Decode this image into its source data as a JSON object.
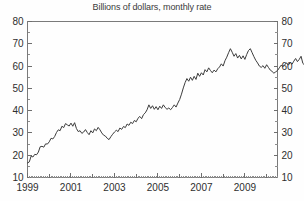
{
  "chart_data": {
    "type": "line",
    "title": "Billions of dollars, monthly rate",
    "xlabel": "",
    "ylabel": "",
    "ylim": [
      10,
      80
    ],
    "xlim": [
      1999.0,
      2010.5
    ],
    "ytick_step": 10,
    "yticks": [
      10,
      20,
      30,
      40,
      50,
      60,
      70,
      80
    ],
    "ytick_labels": [
      "10",
      "20",
      "30",
      "40",
      "50",
      "60",
      "70",
      "80"
    ],
    "y_minor_step": 5,
    "xticks": [
      1999,
      2001,
      2003,
      2005,
      2007,
      2009
    ],
    "xtick_labels": [
      "1999",
      "2001",
      "2003",
      "2005",
      "2007",
      "2009"
    ],
    "x_minor_interval": "monthly",
    "grid": false,
    "legend": "none",
    "dual_y_axis": true,
    "y_axis_right_labels": [
      "10",
      "20",
      "30",
      "40",
      "50",
      "60",
      "70",
      "80"
    ],
    "line_color": "#3c3c3c",
    "frame_color": "#7a7a7a",
    "background_color": "#fefefe",
    "series": [
      {
        "name": "monthly rate",
        "x_start": 1999.0,
        "x_step": 0.0833333,
        "values": [
          16.5,
          17.0,
          19.6,
          19.2,
          20.4,
          20.2,
          21.4,
          23.8,
          24.0,
          23.6,
          25.1,
          25.0,
          26.0,
          27.6,
          27.3,
          28.4,
          30.2,
          31.4,
          31.0,
          33.0,
          32.4,
          34.2,
          33.6,
          33.1,
          34.4,
          33.0,
          34.6,
          32.0,
          30.6,
          31.0,
          29.8,
          30.4,
          31.5,
          30.2,
          29.2,
          31.0,
          30.0,
          31.8,
          31.0,
          32.5,
          31.4,
          30.0,
          29.0,
          28.6,
          27.6,
          27.0,
          28.3,
          29.4,
          30.4,
          31.2,
          30.6,
          32.2,
          31.6,
          32.9,
          32.4,
          34.0,
          33.4,
          34.8,
          34.2,
          35.6,
          35.0,
          36.6,
          37.4,
          36.4,
          38.2,
          39.0,
          40.4,
          42.6,
          41.0,
          42.2,
          40.6,
          41.8,
          40.4,
          42.0,
          41.0,
          42.6,
          41.4,
          40.6,
          41.2,
          40.4,
          41.4,
          42.6,
          41.6,
          43.4,
          45.0,
          47.4,
          50.2,
          52.6,
          54.4,
          53.2,
          55.0,
          53.6,
          55.4,
          54.0,
          56.8,
          55.4,
          57.0,
          56.0,
          58.4,
          57.4,
          59.2,
          58.0,
          57.0,
          58.2,
          57.4,
          58.8,
          59.6,
          61.0,
          60.0,
          62.4,
          64.0,
          66.0,
          67.8,
          66.2,
          64.4,
          65.6,
          63.6,
          64.8,
          63.2,
          64.6,
          63.0,
          65.2,
          67.0,
          67.8,
          66.0,
          64.2,
          62.6,
          61.4,
          60.0,
          59.4,
          60.2,
          59.0,
          60.6,
          59.4,
          58.2,
          57.6,
          56.8,
          57.4,
          58.0,
          59.2,
          60.4,
          59.8,
          60.6,
          61.4,
          60.4,
          61.6,
          60.8,
          62.2,
          63.4,
          62.0,
          63.0,
          64.4,
          61.2,
          60.4,
          60.0,
          54.0,
          48.0,
          43.2,
          40.0,
          37.0,
          34.0,
          31.0,
          28.4,
          26.6,
          27.6,
          29.4,
          28.6,
          30.4,
          29.2,
          31.0,
          30.4,
          32.6,
          31.6,
          33.4,
          32.4,
          34.6,
          33.6,
          35.4,
          34.4,
          36.6,
          35.6,
          37.6,
          36.8,
          39.0,
          40.0,
          38.4,
          37.2
        ]
      }
    ]
  }
}
